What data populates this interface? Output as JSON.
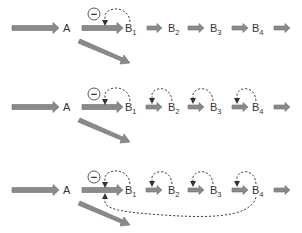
{
  "diagram": {
    "type": "pathway feedback inhibition schematic",
    "colors": {
      "arrow_fill": "#8a8a8a",
      "arrow_stroke": "#6e6e6e",
      "dashed_line": "#444444",
      "text": "#333333",
      "background": "#ffffff"
    },
    "inhibition_symbol": "−",
    "rows": [
      {
        "id": "row-1",
        "description": "B1 inhibits A→B1 step only",
        "nodes": [
          {
            "label": "A",
            "sub": ""
          },
          {
            "label": "B",
            "sub": "1"
          },
          {
            "label": "B",
            "sub": "2"
          },
          {
            "label": "B",
            "sub": "3"
          },
          {
            "label": "B",
            "sub": "4"
          }
        ],
        "feedback_loops": [
          "B1→A-B1 step"
        ]
      },
      {
        "id": "row-2",
        "description": "Each B inhibits its own formation",
        "nodes": [
          {
            "label": "A",
            "sub": ""
          },
          {
            "label": "B",
            "sub": "1"
          },
          {
            "label": "B",
            "sub": "2"
          },
          {
            "label": "B",
            "sub": "3"
          },
          {
            "label": "B",
            "sub": "4"
          }
        ],
        "feedback_loops": [
          "B1→A-B1 step",
          "B2→B1-B2 step",
          "B3→B2-B3 step",
          "B4→B3-B4 step"
        ]
      },
      {
        "id": "row-3",
        "description": "Each B inhibits its own formation plus B4 inhibits A→B1 step",
        "nodes": [
          {
            "label": "A",
            "sub": ""
          },
          {
            "label": "B",
            "sub": "1"
          },
          {
            "label": "B",
            "sub": "2"
          },
          {
            "label": "B",
            "sub": "3"
          },
          {
            "label": "B",
            "sub": "4"
          }
        ],
        "feedback_loops": [
          "B1→A-B1 step",
          "B2→B1-B2 step",
          "B3→B2-B3 step",
          "B4→B3-B4 step",
          "B4→A-B1 step (long range)"
        ]
      }
    ]
  }
}
